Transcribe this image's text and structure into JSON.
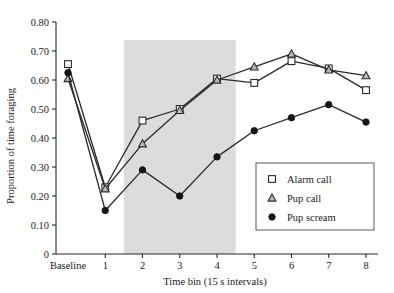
{
  "chart_data": {
    "type": "line",
    "title": "",
    "xlabel": "Time bin (15 s intervals)",
    "ylabel": "Proportion of time foraging",
    "categories": [
      "Baseline",
      "1",
      "2",
      "3",
      "4",
      "5",
      "6",
      "7",
      "8"
    ],
    "xtick_labels": [
      "Baseline",
      "1",
      "2",
      "3",
      "4",
      "5",
      "6",
      "7",
      "8"
    ],
    "ytick_labels": [
      "0",
      "0.10",
      "0.20",
      "0.30",
      "0.40",
      "0.50",
      "0.60",
      "0.70",
      "0.80"
    ],
    "ytick_values": [
      0,
      0.1,
      0.2,
      0.3,
      0.4,
      0.5,
      0.6,
      0.7,
      0.8
    ],
    "ylim": [
      0,
      0.8
    ],
    "grid": false,
    "legend_position": "right-center",
    "series": [
      {
        "name": "Alarm call",
        "marker": "open-square",
        "values": [
          0.655,
          0.23,
          0.46,
          0.5,
          0.605,
          0.59,
          0.665,
          0.64,
          0.565
        ]
      },
      {
        "name": "Pup call",
        "marker": "open-triangle",
        "values": [
          0.605,
          0.225,
          0.38,
          0.495,
          0.6,
          0.645,
          0.69,
          0.635,
          0.615
        ]
      },
      {
        "name": "Pup scream",
        "marker": "filled-circle",
        "values": [
          0.625,
          0.15,
          0.29,
          0.2,
          0.335,
          0.425,
          0.47,
          0.515,
          0.455
        ]
      }
    ],
    "annotations": [
      {
        "type": "shaded-band",
        "label": "playback period",
        "x_start_category_index": 1.5,
        "x_end_category_index": 4.5,
        "color": "#dcdcdc"
      }
    ]
  },
  "legend": {
    "entries": [
      {
        "label": "Alarm call",
        "marker": "open-square"
      },
      {
        "label": "Pup call",
        "marker": "open-triangle"
      },
      {
        "label": "Pup scream",
        "marker": "filled-circle"
      }
    ]
  }
}
